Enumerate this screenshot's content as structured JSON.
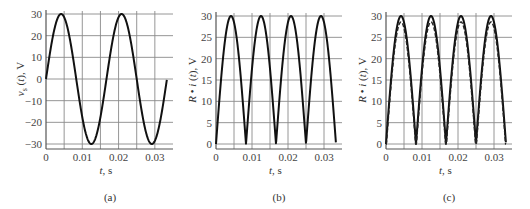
{
  "figure": {
    "panels": [
      {
        "caption": "(a)",
        "ylabel": "v_s (t), V",
        "xlabel": "t, s"
      },
      {
        "caption": "(b)",
        "ylabel": "R • i (t), V",
        "xlabel": "t, s"
      },
      {
        "caption": "(c)",
        "ylabel": "R • i (t), V",
        "xlabel": "t, s"
      }
    ]
  },
  "chart_data": [
    {
      "type": "line",
      "title": "(a)",
      "xlabel": "t, s",
      "ylabel": "v_s(t), V",
      "xlim": [
        0,
        0.035
      ],
      "ylim": [
        -32,
        32
      ],
      "xticks": [
        0,
        0.01,
        0.02,
        0.03
      ],
      "xtick_labels": [
        "0",
        "0.01",
        "0.02",
        "0.03"
      ],
      "yticks": [
        -30,
        -20,
        -10,
        0,
        10,
        20,
        30
      ],
      "ytick_labels": [
        "−30",
        "−20",
        "−10",
        "0",
        "10",
        "20",
        "30"
      ],
      "grid": true,
      "series": [
        {
          "name": "v_s(t)",
          "style": "solid",
          "function": "30*sin(2*pi*60*t)",
          "amplitude": 30,
          "frequency_hz": 60,
          "rectified": false,
          "t_end": 0.0333,
          "x": [
            0,
            0.00417,
            0.00833,
            0.0125,
            0.01667,
            0.02083,
            0.025,
            0.02917,
            0.0333
          ],
          "values": [
            0,
            30,
            0,
            -30,
            0,
            30,
            0,
            -30,
            0
          ]
        }
      ]
    },
    {
      "type": "line",
      "title": "(b)",
      "xlabel": "t, s",
      "ylabel": "R • i(t), V",
      "xlim": [
        0,
        0.035
      ],
      "ylim": [
        -1,
        30.5
      ],
      "xticks": [
        0,
        0.01,
        0.02,
        0.03
      ],
      "xtick_labels": [
        "0",
        "0.01",
        "0.02",
        "0.03"
      ],
      "yticks": [
        0,
        5,
        10,
        15,
        20,
        25,
        30
      ],
      "ytick_labels": [
        "0",
        "5",
        "10",
        "15",
        "20",
        "25",
        "30"
      ],
      "grid": true,
      "series": [
        {
          "name": "R·i(t)",
          "style": "solid",
          "function": "|30*sin(2*pi*60*t)|",
          "amplitude": 30,
          "frequency_hz": 60,
          "rectified": true,
          "t_end": 0.0333,
          "x": [
            0,
            0.00417,
            0.00833,
            0.0125,
            0.01667,
            0.02083,
            0.025,
            0.02917,
            0.0333
          ],
          "values": [
            0,
            30,
            0,
            30,
            0,
            30,
            0,
            30,
            0
          ]
        }
      ]
    },
    {
      "type": "line",
      "title": "(c)",
      "xlabel": "t, s",
      "ylabel": "R • i(t), V",
      "xlim": [
        0,
        0.035
      ],
      "ylim": [
        -1,
        30.5
      ],
      "xticks": [
        0,
        0.01,
        0.02,
        0.03
      ],
      "xtick_labels": [
        "0",
        "0.01",
        "0.02",
        "0.03"
      ],
      "yticks": [
        0,
        5,
        10,
        15,
        20,
        25,
        30
      ],
      "ytick_labels": [
        "0",
        "5",
        "10",
        "15",
        "20",
        "25",
        "30"
      ],
      "grid": true,
      "series": [
        {
          "name": "ideal",
          "style": "solid",
          "function": "|30*sin(2*pi*60*t)|",
          "amplitude": 30,
          "frequency_hz": 60,
          "rectified": true,
          "t_end": 0.0333,
          "x": [
            0,
            0.00417,
            0.00833,
            0.0125,
            0.01667,
            0.02083,
            0.025,
            0.02917,
            0.0333
          ],
          "values": [
            0,
            30,
            0,
            30,
            0,
            30,
            0,
            30,
            0
          ]
        },
        {
          "name": "with diode drop",
          "style": "dashed",
          "function": "max(|30*sin(2*pi*60*t)|-1.4,0)",
          "amplitude": 28.6,
          "frequency_hz": 60,
          "rectified": true,
          "offset": 1.4,
          "t_end": 0.0333,
          "x": [
            0,
            0.00417,
            0.00833,
            0.0125,
            0.01667,
            0.02083,
            0.025,
            0.02917,
            0.0333
          ],
          "values": [
            0,
            28.6,
            0,
            28.6,
            0,
            28.6,
            0,
            28.6,
            0
          ]
        }
      ]
    }
  ]
}
